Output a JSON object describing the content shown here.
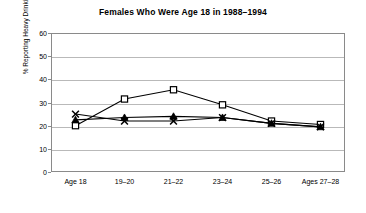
{
  "chart_data": {
    "type": "line",
    "title": "Females Who Were Age 18 in 1988–1994",
    "xlabel": "",
    "ylabel": "% Reporting Heavy Drinking",
    "categories": [
      "Age 18",
      "19–20",
      "21–22",
      "23–24",
      "25–26",
      "Ages 27–28"
    ],
    "ylim": [
      0,
      60
    ],
    "yticks": [
      0,
      10,
      20,
      30,
      40,
      50,
      60
    ],
    "grid": true,
    "legend": "none",
    "series": [
      {
        "name": "square-series",
        "marker": "open-square",
        "color": "#000000",
        "values": [
          20,
          31.5,
          35.5,
          29,
          22,
          20.5
        ]
      },
      {
        "name": "x-series",
        "marker": "x-cross",
        "color": "#000000",
        "values": [
          25,
          22,
          22,
          23.5,
          21,
          19.5
        ]
      },
      {
        "name": "triangle-series",
        "marker": "filled-triangle",
        "color": "#000000",
        "values": [
          22.5,
          23.5,
          24,
          23.5,
          21,
          19.5
        ]
      }
    ]
  },
  "axis": {
    "y_title": "% Reporting Heavy Drinking",
    "y_labels": [
      "60",
      "50",
      "40",
      "30",
      "20",
      "10",
      "0"
    ]
  }
}
